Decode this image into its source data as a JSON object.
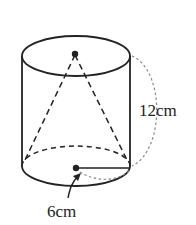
{
  "diagram": {
    "type": "cylinder-with-inscribed-cone",
    "labels": {
      "height": "12cm",
      "radius": "6cm"
    },
    "colors": {
      "stroke": "#222222",
      "dotted": "#888888",
      "background": "#ffffff"
    }
  }
}
